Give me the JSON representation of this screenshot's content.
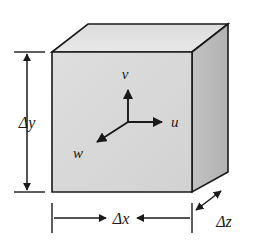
{
  "figure": {
    "type": "3d-cube-diagram",
    "background_color": "#ffffff",
    "line_color": "#1a1a1a"
  },
  "cube": {
    "name": "rectangular-control-volume",
    "faces": {
      "front": {
        "label": "front-face",
        "fill": "#d9d9d9",
        "points": "52,52 192,52 192,192 52,192"
      },
      "top": {
        "label": "top-face",
        "fill": "#e6e6e6",
        "points": "52,52 88,24 228,24 192,52"
      },
      "right": {
        "label": "right-face",
        "fill": "#b9b9b9",
        "points": "192,52 228,24 228,172 192,192"
      }
    },
    "stroke_color": "#1a1a1a",
    "stroke_width": 1.6
  },
  "axes": {
    "origin": {
      "x": 128,
      "y": 122
    },
    "vectors": [
      {
        "name": "v-axis",
        "label": "v",
        "direction": "up",
        "tip_x": 128,
        "tip_y": 88,
        "label_x": 125,
        "label_y": 78
      },
      {
        "name": "u-axis",
        "label": "u",
        "direction": "right",
        "tip_x": 164,
        "tip_y": 122,
        "label_x": 172,
        "label_y": 126
      },
      {
        "name": "w-axis",
        "label": "w",
        "direction": "down-left",
        "tip_x": 95,
        "tip_y": 144,
        "label_x": 76,
        "label_y": 157
      }
    ]
  },
  "dimensions": [
    {
      "name": "delta-y-dimension",
      "delta": "Δ",
      "variable": "y",
      "label": "Δy",
      "orientation": "vertical",
      "label_x": 27,
      "label_y": 128,
      "line": {
        "x1": 27,
        "y1": 52,
        "x2": 27,
        "y2": 192
      },
      "ticks": [
        {
          "x1": 13,
          "y1": 52,
          "x2": 45,
          "y2": 52
        },
        {
          "x1": 13,
          "y1": 192,
          "x2": 45,
          "y2": 192
        }
      ]
    },
    {
      "name": "delta-x-dimension",
      "delta": "Δ",
      "variable": "x",
      "label": "Δx",
      "orientation": "horizontal",
      "label_x": 121,
      "label_y": 224,
      "line": {
        "x1": 52,
        "y1": 218,
        "x2": 192,
        "y2": 218
      },
      "ticks": [
        {
          "x1": 52,
          "y1": 204,
          "x2": 52,
          "y2": 232
        },
        {
          "x1": 192,
          "y1": 204,
          "x2": 192,
          "y2": 232
        }
      ]
    },
    {
      "name": "delta-z-dimension",
      "delta": "Δ",
      "variable": "z",
      "label": "Δz",
      "orientation": "diagonal",
      "label_x": 222,
      "label_y": 226,
      "line": {
        "x1": 195,
        "y1": 211,
        "x2": 222,
        "y2": 190
      },
      "ticks": []
    }
  ]
}
